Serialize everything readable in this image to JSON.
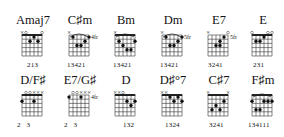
{
  "diagram": {
    "rows": 2,
    "columns": 6
  },
  "chords": [
    {
      "name": "Amaj7",
      "x": 10,
      "y": 13,
      "mutes": [],
      "open": [
        1,
        5
      ],
      "muteMarks": [
        0
      ],
      "barre": {
        "fret": 0,
        "from": 0,
        "to": 5,
        "nut": true
      },
      "dots": [
        [
          3,
          1
        ],
        [
          2,
          2
        ],
        [
          4,
          2
        ]
      ],
      "fretLabel": "",
      "arc": false,
      "fingering": "213",
      "fingerX": 17
    },
    {
      "name": "C♯m",
      "x": 57,
      "y": 13,
      "muteMarks": [
        0
      ],
      "open": [],
      "barre": null,
      "dots": [
        [
          1,
          1
        ],
        [
          5,
          1
        ],
        [
          2,
          3
        ],
        [
          3,
          3
        ],
        [
          4,
          2
        ]
      ],
      "fretLabel": "4fr",
      "arc": true,
      "fingering": "13421",
      "fingerX": 10
    },
    {
      "name": "Bm",
      "x": 103,
      "y": 13,
      "muteMarks": [
        0
      ],
      "open": [],
      "barre": {
        "fret": 0,
        "from": 0,
        "to": 5,
        "nut": true
      },
      "dots": [
        [
          1,
          2
        ],
        [
          5,
          2
        ],
        [
          3,
          4
        ],
        [
          4,
          4
        ],
        [
          2,
          3
        ]
      ],
      "fretLabel": "",
      "arc": true,
      "fingering": "13421",
      "fingerX": 10
    },
    {
      "name": "Dm",
      "x": 150,
      "y": 13,
      "muteMarks": [
        0
      ],
      "open": [],
      "barre": null,
      "dots": [
        [
          1,
          1
        ],
        [
          5,
          1
        ],
        [
          2,
          3
        ],
        [
          3,
          3
        ],
        [
          4,
          2
        ]
      ],
      "fretLabel": "5fr",
      "arc": true,
      "fingering": "13421",
      "fingerX": 10
    },
    {
      "name": "E7",
      "x": 196,
      "y": 13,
      "muteMarks": [
        0
      ],
      "open": [
        5
      ],
      "barre": null,
      "dots": [
        [
          4,
          1
        ],
        [
          3,
          2
        ],
        [
          2,
          3
        ],
        [
          3,
          3
        ]
      ],
      "fretLabel": "5fr",
      "arc": false,
      "fingering": "3241",
      "fingerX": 12
    },
    {
      "name": "E",
      "x": 240,
      "y": 13,
      "muteMarks": [],
      "open": [
        0,
        4,
        5
      ],
      "barre": {
        "fret": 0,
        "from": 0,
        "to": 5,
        "nut": true
      },
      "dots": [
        [
          3,
          1
        ],
        [
          1,
          2
        ],
        [
          2,
          2
        ]
      ],
      "fretLabel": "",
      "arc": false,
      "fingering": "231",
      "fingerX": 13
    },
    {
      "name": "D/F♯",
      "x": 10,
      "y": 73,
      "muteMarks": [
        3,
        4,
        5
      ],
      "open": [
        1,
        2
      ],
      "barre": {
        "fret": 0,
        "from": 0,
        "to": 5,
        "nut": true
      },
      "dots": [
        [
          0,
          2
        ],
        [
          3,
          2
        ]
      ],
      "fretLabel": "",
      "arc": false,
      "fingering": "2   3",
      "fingerX": 7
    },
    {
      "name": "E7/G♯",
      "x": 57,
      "y": 73,
      "muteMarks": [
        3,
        4,
        5
      ],
      "open": [
        1,
        2
      ],
      "barre": null,
      "dots": [
        [
          0,
          1
        ],
        [
          3,
          1
        ]
      ],
      "fretLabel": "4fr",
      "arc": false,
      "fingering": "2   3",
      "fingerX": 7
    },
    {
      "name": "D",
      "x": 103,
      "y": 73,
      "muteMarks": [
        0,
        1
      ],
      "open": [
        2
      ],
      "barre": {
        "fret": 0,
        "from": 0,
        "to": 5,
        "nut": true
      },
      "dots": [
        [
          3,
          2
        ],
        [
          5,
          2
        ],
        [
          4,
          3
        ]
      ],
      "fretLabel": "",
      "arc": false,
      "fingering": "132",
      "fingerX": 20
    },
    {
      "name": "D♯°7",
      "x": 150,
      "y": 73,
      "muteMarks": [
        0,
        1
      ],
      "open": [],
      "barre": {
        "fret": 0,
        "from": 0,
        "to": 5,
        "nut": true
      },
      "dots": [
        [
          2,
          1
        ],
        [
          4,
          1
        ],
        [
          3,
          2
        ],
        [
          5,
          2
        ]
      ],
      "fretLabel": "",
      "arc": false,
      "fingering": "1324",
      "fingerX": 15
    },
    {
      "name": "C♯7",
      "x": 196,
      "y": 73,
      "muteMarks": [
        0,
        5
      ],
      "open": [],
      "barre": {
        "fret": 0,
        "from": 0,
        "to": 5,
        "nut": true
      },
      "dots": [
        [
          4,
          2
        ],
        [
          2,
          3
        ],
        [
          1,
          4
        ],
        [
          3,
          4
        ]
      ],
      "fretLabel": "",
      "arc": false,
      "fingering": "3241",
      "fingerX": 13
    },
    {
      "name": "F♯m",
      "x": 240,
      "y": 73,
      "muteMarks": [],
      "open": [],
      "barre": {
        "fret": 0,
        "from": 0,
        "to": 5,
        "nut": true
      },
      "dots": [
        [
          0,
          2
        ],
        [
          3,
          2
        ],
        [
          4,
          2
        ],
        [
          5,
          2
        ],
        [
          1,
          4
        ],
        [
          2,
          4
        ]
      ],
      "fretLabel": "",
      "arc": true,
      "fingering": "134111",
      "fingerX": 8
    }
  ]
}
